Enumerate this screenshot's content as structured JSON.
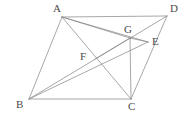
{
  "figure": {
    "type": "geometry-diagram",
    "canvas": {
      "width": 192,
      "height": 119,
      "background": "#ffffff"
    },
    "style": {
      "line_color": "#8a8a8a",
      "line_width": 0.75,
      "label_color": "#4a4a4a",
      "label_font_size": 11
    },
    "points": [
      {
        "id": "A",
        "label": "A",
        "x": 62,
        "y": 17,
        "label_x": 53,
        "label_y": 3,
        "kind": "vertex"
      },
      {
        "id": "D",
        "label": "D",
        "x": 167,
        "y": 16,
        "label_x": 170,
        "label_y": 3,
        "kind": "vertex"
      },
      {
        "id": "B",
        "label": "B",
        "x": 29,
        "y": 99,
        "label_x": 16,
        "label_y": 99,
        "kind": "vertex"
      },
      {
        "id": "C",
        "label": "C",
        "x": 131,
        "y": 99,
        "label_x": 128,
        "label_y": 101,
        "kind": "vertex"
      },
      {
        "id": "G",
        "label": "G",
        "x": 130,
        "y": 38,
        "label_x": 124,
        "label_y": 24,
        "kind": "interior-point"
      },
      {
        "id": "E",
        "label": "E",
        "x": 148,
        "y": 42,
        "label_x": 152,
        "label_y": 36,
        "kind": "interior-point"
      },
      {
        "id": "F",
        "label": "F",
        "x": 95,
        "y": 59,
        "label_x": 80,
        "label_y": 51,
        "kind": "interior-point"
      }
    ],
    "segments": [
      {
        "id": "AD",
        "from": "A",
        "to": "D",
        "role": "parallelogram-side"
      },
      {
        "id": "AB",
        "from": "A",
        "to": "B",
        "role": "parallelogram-side"
      },
      {
        "id": "BC",
        "from": "B",
        "to": "C",
        "role": "parallelogram-side"
      },
      {
        "id": "CD",
        "from": "C",
        "to": "D",
        "role": "parallelogram-side"
      },
      {
        "id": "AC",
        "from": "A",
        "to": "C",
        "role": "diagonal"
      },
      {
        "id": "BD",
        "from": "B",
        "to": "D",
        "role": "diagonal"
      },
      {
        "id": "AE",
        "from": "A",
        "to": "E",
        "role": "cevian"
      },
      {
        "id": "AG",
        "from": "A",
        "to": "G",
        "role": "cevian"
      },
      {
        "id": "CG",
        "from": "C",
        "to": "G",
        "role": "cevian"
      },
      {
        "id": "GE",
        "from": "G",
        "to": "E",
        "role": "segment"
      },
      {
        "id": "BE",
        "from": "B",
        "to": "E",
        "role": "cevian-through-F"
      },
      {
        "id": "FG",
        "from": "F",
        "to": "G",
        "role": "segment"
      }
    ]
  }
}
